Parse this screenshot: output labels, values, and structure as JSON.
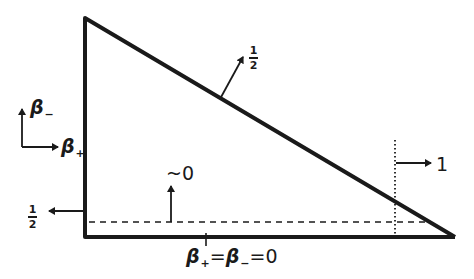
{
  "diagram": {
    "type": "triangle-domain-sketch",
    "colors": {
      "ink": "#1a1a1a",
      "background": "#ffffff"
    },
    "axes": {
      "vertical": {
        "symbol": "β",
        "subscript": "−"
      },
      "horizontal": {
        "symbol": "β",
        "subscript": "+"
      }
    },
    "labels": {
      "hypotenuse_value": {
        "numerator": "1",
        "denominator": "2"
      },
      "left_edge_value": {
        "numerator": "1",
        "denominator": "2"
      },
      "near_bottom_value": "~0",
      "right_dotted_value": "1",
      "origin_label": {
        "b1": "β",
        "sub1": "+",
        "eq1": "=",
        "b2": "β",
        "sub2": "−",
        "eq2": "=0"
      }
    }
  }
}
